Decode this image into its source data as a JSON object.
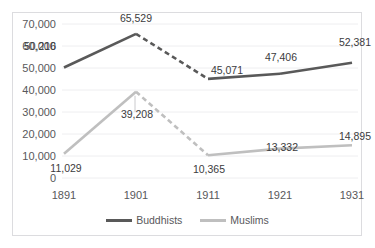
{
  "chart_data": {
    "type": "line",
    "title": "",
    "xlabel": "",
    "ylabel": "",
    "categories": [
      "1891",
      "1901",
      "1911",
      "1921",
      "1931"
    ],
    "ylim": [
      0,
      70000
    ],
    "ytick_labels": [
      "70,000",
      "60,000",
      "50,000",
      "40,000",
      "30,000",
      "20,000",
      "10,000",
      "0"
    ],
    "ytick_values": [
      70000,
      60000,
      50000,
      40000,
      30000,
      20000,
      10000,
      0
    ],
    "grid": true,
    "legend_position": "bottom",
    "series": [
      {
        "name": "Buddhists",
        "color": "#595959",
        "values": [
          50216,
          65529,
          45071,
          47406,
          52381
        ],
        "labels": [
          "50,216",
          "65,529",
          "45,071",
          "47,406",
          "52,381"
        ],
        "dashed_segments": [
          [
            1,
            2
          ]
        ]
      },
      {
        "name": "Muslims",
        "color": "#bfbfbf",
        "values": [
          11029,
          39208,
          10365,
          13332,
          14895
        ],
        "labels": [
          "11,029",
          "39,208",
          "10,365",
          "13,332",
          "14,895"
        ],
        "dashed_segments": [
          [
            1,
            2
          ]
        ]
      }
    ]
  },
  "legend": {
    "entries": [
      {
        "label": "Buddhists",
        "color": "#595959"
      },
      {
        "label": "Muslims",
        "color": "#bfbfbf"
      }
    ]
  },
  "colors": {
    "buddhists": "#595959",
    "muslims": "#bfbfbf",
    "gridline": "#eeeef0",
    "border": "#dcdcdf",
    "tick_text": "#58585b",
    "label_text": "#3b3b3d",
    "background": "#ffffff"
  }
}
